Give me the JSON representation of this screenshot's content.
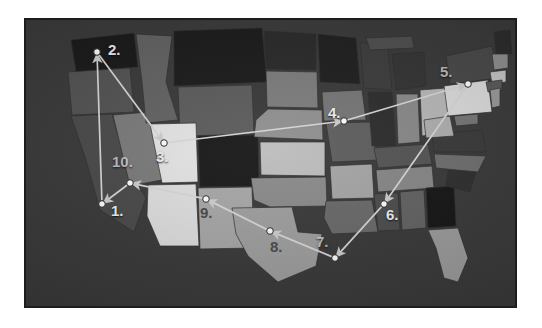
{
  "figure": {
    "kind": "route-map",
    "region": "United States (contiguous)",
    "frame_color": "#3a3a3a",
    "frame_border_color": "#1d1d1d",
    "page_background": "#ffffff",
    "route_line_color": "#d8d8d8",
    "node_fill": "#ffffff",
    "node_stroke": "#2a2a2a"
  },
  "route": {
    "stops": [
      {
        "id": "1",
        "label": "1.",
        "x": 76,
        "y": 184,
        "label_x": 85,
        "label_y": 183,
        "label_style": "bright"
      },
      {
        "id": "2",
        "label": "2.",
        "x": 71,
        "y": 32,
        "label_x": 82,
        "label_y": 22,
        "label_style": "bright"
      },
      {
        "id": "3",
        "label": "3.",
        "x": 138,
        "y": 123,
        "label_x": 130,
        "label_y": 129,
        "label_style": "bright"
      },
      {
        "id": "4",
        "label": "4.",
        "x": 318,
        "y": 101,
        "label_x": 302,
        "label_y": 85,
        "label_style": "bright"
      },
      {
        "id": "5",
        "label": "5.",
        "x": 442,
        "y": 64,
        "label_x": 414,
        "label_y": 44,
        "label_style": "dim"
      },
      {
        "id": "6",
        "label": "6.",
        "x": 358,
        "y": 184,
        "label_x": 360,
        "label_y": 187,
        "label_style": "bright"
      },
      {
        "id": "7",
        "label": "7.",
        "x": 309,
        "y": 238,
        "label_x": 290,
        "label_y": 214,
        "label_style": "dim"
      },
      {
        "id": "8",
        "label": "8.",
        "x": 244,
        "y": 211,
        "label_x": 244,
        "label_y": 219,
        "label_style": "dark"
      },
      {
        "id": "9",
        "label": "9.",
        "x": 180,
        "y": 179,
        "label_x": 174,
        "label_y": 185,
        "label_style": "dark"
      },
      {
        "id": "10",
        "label": "10.",
        "x": 104,
        "y": 163,
        "label_x": 86,
        "label_y": 134,
        "label_style": "dim"
      }
    ],
    "legs": [
      {
        "from": "1",
        "to": "2"
      },
      {
        "from": "2",
        "to": "3"
      },
      {
        "from": "3",
        "to": "4"
      },
      {
        "from": "4",
        "to": "5"
      },
      {
        "from": "5",
        "to": "6"
      },
      {
        "from": "6",
        "to": "7"
      },
      {
        "from": "7",
        "to": "8"
      },
      {
        "from": "8",
        "to": "9"
      },
      {
        "from": "9",
        "to": "10"
      },
      {
        "from": "10",
        "to": "1"
      }
    ]
  }
}
